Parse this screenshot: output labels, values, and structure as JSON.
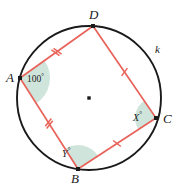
{
  "diagram": {
    "type": "cyclic-quadrilateral-in-circle",
    "circle": {
      "label": "k",
      "center": {
        "x": 89,
        "y": 98
      },
      "radius": 72,
      "stroke_color": "#1a1a1a",
      "center_dot_color": "#1a1a1a"
    },
    "quadrilateral": {
      "stroke_color": "#e8635a",
      "vertices": [
        {
          "name": "A",
          "label": "A",
          "x": 20,
          "y": 78,
          "label_x": 6,
          "label_y": 71
        },
        {
          "name": "D",
          "label": "D",
          "x": 93,
          "y": 26,
          "label_x": 89,
          "label_y": 8
        },
        {
          "name": "C",
          "label": "C",
          "x": 156,
          "y": 118,
          "label_x": 163,
          "label_y": 112
        },
        {
          "name": "B",
          "label": "B",
          "x": 78,
          "y": 169,
          "label_x": 71,
          "label_y": 172
        }
      ],
      "sides": [
        {
          "from": "A",
          "to": "D",
          "ticks": 2
        },
        {
          "from": "D",
          "to": "C",
          "ticks": 1
        },
        {
          "from": "C",
          "to": "B",
          "ticks": 1
        },
        {
          "from": "B",
          "to": "A",
          "ticks": 2
        }
      ]
    },
    "angles": [
      {
        "vertex": "A",
        "text": "100",
        "degree_symbol": "°",
        "numeric": true,
        "fill_color": "#cfe5dc",
        "label_x": 27,
        "label_y": 73
      },
      {
        "vertex": "C",
        "text": "X",
        "degree_symbol": "°",
        "numeric": false,
        "fill_color": "#cfe5dc",
        "label_x": 133,
        "label_y": 112
      },
      {
        "vertex": "B",
        "text": "Y",
        "degree_symbol": "°",
        "numeric": false,
        "fill_color": "#cfe5dc",
        "label_x": 62,
        "label_y": 148
      }
    ],
    "circle_label_pos": {
      "x": 155,
      "y": 44
    }
  }
}
